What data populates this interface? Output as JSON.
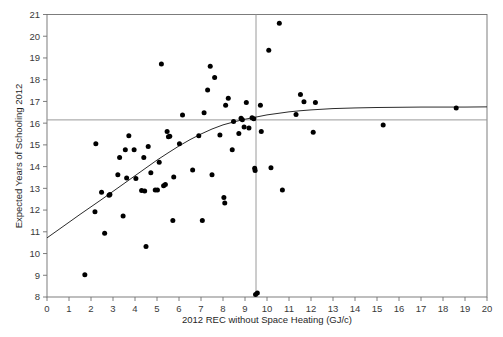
{
  "chart_data": {
    "type": "scatter",
    "title": "",
    "xlabel": "2012 REC without Space Heating (GJ/c)",
    "ylabel": "Expected Years of Schooling 2012",
    "xlim": [
      0,
      20
    ],
    "ylim": [
      8,
      21
    ],
    "xticks": [
      0,
      1,
      2,
      3,
      4,
      5,
      6,
      7,
      8,
      9,
      10,
      11,
      12,
      13,
      14,
      15,
      16,
      17,
      18,
      19,
      20
    ],
    "yticks": [
      8,
      9,
      10,
      11,
      12,
      13,
      14,
      15,
      16,
      17,
      18,
      19,
      20,
      21
    ],
    "xtick_labels": [
      "0",
      "1",
      "2",
      "3",
      "4",
      "5",
      "6",
      "7",
      "8",
      "9",
      "10",
      "11",
      "12",
      "13",
      "14",
      "15",
      "16",
      "17",
      "18",
      "19",
      "20"
    ],
    "ytick_labels": [
      "8",
      "9",
      "10",
      "11",
      "12",
      "13",
      "14",
      "15",
      "16",
      "17",
      "18",
      "19",
      "20",
      "21"
    ],
    "grid": false,
    "legend": false,
    "point_color": "#000000",
    "curve_color": "#2b2b2b",
    "reference_line_color": "#9a9a9a",
    "frame_color": "#6f6f6f",
    "reference_lines": [
      {
        "orientation": "vertical",
        "value": 9.5,
        "label": "vertical reference at 9.5 GJ/c"
      },
      {
        "orientation": "horizontal",
        "value": 16.15,
        "label": "horizontal reference at 16.15 years"
      }
    ],
    "points": [
      [
        1.72,
        9.02
      ],
      [
        2.18,
        11.92
      ],
      [
        2.22,
        15.05
      ],
      [
        2.48,
        12.82
      ],
      [
        2.62,
        10.93
      ],
      [
        2.82,
        12.68
      ],
      [
        2.86,
        12.72
      ],
      [
        3.22,
        13.63
      ],
      [
        3.3,
        14.42
      ],
      [
        3.46,
        11.73
      ],
      [
        3.56,
        14.78
      ],
      [
        3.62,
        13.48
      ],
      [
        3.72,
        15.42
      ],
      [
        3.96,
        14.78
      ],
      [
        4.04,
        13.45
      ],
      [
        4.3,
        12.9
      ],
      [
        4.4,
        14.42
      ],
      [
        4.44,
        12.88
      ],
      [
        4.5,
        10.32
      ],
      [
        4.6,
        14.92
      ],
      [
        4.72,
        13.72
      ],
      [
        4.92,
        12.92
      ],
      [
        5.02,
        12.92
      ],
      [
        5.1,
        14.2
      ],
      [
        5.2,
        18.72
      ],
      [
        5.3,
        13.12
      ],
      [
        5.38,
        13.18
      ],
      [
        5.46,
        15.62
      ],
      [
        5.52,
        15.38
      ],
      [
        5.58,
        15.4
      ],
      [
        5.72,
        11.52
      ],
      [
        5.76,
        13.52
      ],
      [
        6.02,
        15.05
      ],
      [
        6.16,
        16.38
      ],
      [
        6.62,
        13.85
      ],
      [
        6.9,
        15.42
      ],
      [
        7.06,
        11.52
      ],
      [
        7.14,
        16.48
      ],
      [
        7.3,
        17.52
      ],
      [
        7.42,
        18.62
      ],
      [
        7.5,
        13.63
      ],
      [
        7.62,
        18.1
      ],
      [
        7.86,
        15.45
      ],
      [
        8.04,
        12.58
      ],
      [
        8.08,
        12.32
      ],
      [
        8.12,
        16.82
      ],
      [
        8.24,
        17.15
      ],
      [
        8.42,
        14.78
      ],
      [
        8.48,
        16.08
      ],
      [
        8.72,
        15.52
      ],
      [
        8.82,
        16.22
      ],
      [
        8.88,
        16.16
      ],
      [
        8.96,
        15.82
      ],
      [
        9.06,
        16.95
      ],
      [
        9.18,
        15.78
      ],
      [
        9.32,
        16.25
      ],
      [
        9.4,
        16.2
      ],
      [
        9.44,
        13.92
      ],
      [
        9.46,
        13.82
      ],
      [
        9.48,
        8.12
      ],
      [
        9.56,
        8.18
      ],
      [
        9.7,
        16.82
      ],
      [
        9.74,
        15.62
      ],
      [
        10.08,
        19.35
      ],
      [
        10.18,
        13.95
      ],
      [
        10.56,
        20.6
      ],
      [
        10.7,
        12.92
      ],
      [
        11.32,
        16.4
      ],
      [
        11.52,
        17.32
      ],
      [
        11.68,
        16.98
      ],
      [
        12.1,
        15.58
      ],
      [
        12.2,
        16.95
      ],
      [
        15.28,
        15.92
      ],
      [
        18.6,
        16.7
      ]
    ],
    "fit_curve": {
      "description": "smoothed saturating fit curve",
      "points": [
        [
          0.0,
          10.72
        ],
        [
          0.5,
          11.08
        ],
        [
          1.0,
          11.44
        ],
        [
          1.5,
          11.8
        ],
        [
          2.0,
          12.15
        ],
        [
          2.5,
          12.5
        ],
        [
          3.0,
          12.86
        ],
        [
          3.5,
          13.22
        ],
        [
          4.0,
          13.58
        ],
        [
          4.5,
          13.94
        ],
        [
          5.0,
          14.3
        ],
        [
          5.5,
          14.63
        ],
        [
          6.0,
          14.95
        ],
        [
          6.5,
          15.24
        ],
        [
          7.0,
          15.5
        ],
        [
          7.5,
          15.73
        ],
        [
          8.0,
          15.92
        ],
        [
          8.5,
          16.06
        ],
        [
          9.0,
          16.18
        ],
        [
          9.5,
          16.28
        ],
        [
          10.0,
          16.38
        ],
        [
          10.5,
          16.45
        ],
        [
          11.0,
          16.52
        ],
        [
          11.5,
          16.57
        ],
        [
          12.0,
          16.61
        ],
        [
          13.0,
          16.67
        ],
        [
          14.0,
          16.7
        ],
        [
          15.0,
          16.72
        ],
        [
          16.0,
          16.73
        ],
        [
          17.0,
          16.74
        ],
        [
          18.0,
          16.74
        ],
        [
          19.0,
          16.74
        ],
        [
          20.0,
          16.75
        ]
      ]
    }
  },
  "axes": {
    "x_title": "2012 REC without Space Heating (GJ/c)",
    "y_title": "Expected Years of Schooling 2012"
  }
}
